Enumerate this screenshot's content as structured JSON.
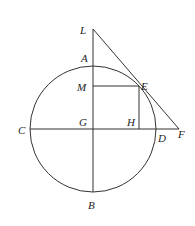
{
  "diagram": {
    "type": "geometry",
    "circle": {
      "center": "G",
      "cx": 93,
      "cy": 129,
      "r": 63
    },
    "points": {
      "L": {
        "label": "L",
        "x": 93,
        "y": 37
      },
      "A": {
        "label": "A",
        "x": 93,
        "y": 66
      },
      "M": {
        "label": "M",
        "x": 93,
        "y": 86
      },
      "E": {
        "label": "E",
        "x": 139,
        "y": 86
      },
      "C": {
        "label": "C",
        "x": 30,
        "y": 129
      },
      "G": {
        "label": "G",
        "x": 93,
        "y": 129
      },
      "H": {
        "label": "H",
        "x": 139,
        "y": 129
      },
      "D": {
        "label": "D",
        "x": 156,
        "y": 129
      },
      "F": {
        "label": "F",
        "x": 179,
        "y": 129
      },
      "B": {
        "label": "B",
        "x": 93,
        "y": 192
      }
    },
    "segments": [
      "LB",
      "CF",
      "LF",
      "ME",
      "EH"
    ],
    "colors": {
      "stroke": "#333333",
      "background": "#ffffff"
    }
  }
}
